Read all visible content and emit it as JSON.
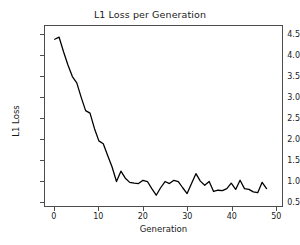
{
  "chart_data": {
    "type": "line",
    "title": "L1 Loss per Generation",
    "xlabel": "Generation",
    "ylabel": "L1 Loss",
    "xlim": [
      -2.2,
      51.5
    ],
    "ylim": [
      0.38,
      4.72
    ],
    "grid": false,
    "legend": null,
    "line_color": "#000000",
    "line_width": 1.3,
    "xticks": [
      0,
      10,
      20,
      30,
      40,
      50
    ],
    "xtick_labels": [
      "0",
      "10",
      "20",
      "30",
      "40",
      "50"
    ],
    "yticks": [
      0.5,
      1.0,
      1.5,
      2.0,
      2.5,
      3.0,
      3.5,
      4.0,
      4.5
    ],
    "ytick_labels": [
      "0.5",
      "1.0",
      "1.5",
      "2.0",
      "2.5",
      "3.0",
      "3.5",
      "4.0",
      "4.5"
    ],
    "series": [
      {
        "name": "L1 Loss",
        "x": [
          0,
          1,
          2,
          3,
          4,
          5,
          6,
          7,
          8,
          9,
          10,
          11,
          12,
          13,
          14,
          15,
          16,
          17,
          18,
          19,
          20,
          21,
          22,
          23,
          24,
          25,
          26,
          27,
          28,
          29,
          30,
          31,
          32,
          33,
          34,
          35,
          36,
          37,
          38,
          39,
          40,
          41,
          42,
          43,
          44,
          45,
          46,
          47,
          48
        ],
        "values": [
          4.4,
          4.45,
          4.1,
          3.78,
          3.5,
          3.35,
          3.0,
          2.68,
          2.62,
          2.25,
          1.95,
          1.88,
          1.6,
          1.32,
          0.97,
          1.22,
          1.05,
          0.95,
          0.93,
          0.92,
          1.0,
          0.97,
          0.8,
          0.64,
          0.82,
          0.97,
          0.92,
          1.0,
          0.97,
          0.82,
          0.68,
          0.92,
          1.16,
          0.98,
          0.88,
          0.97,
          0.73,
          0.76,
          0.75,
          0.8,
          0.93,
          0.78,
          1.0,
          0.8,
          0.78,
          0.72,
          0.7,
          0.95,
          0.8
        ]
      }
    ]
  }
}
